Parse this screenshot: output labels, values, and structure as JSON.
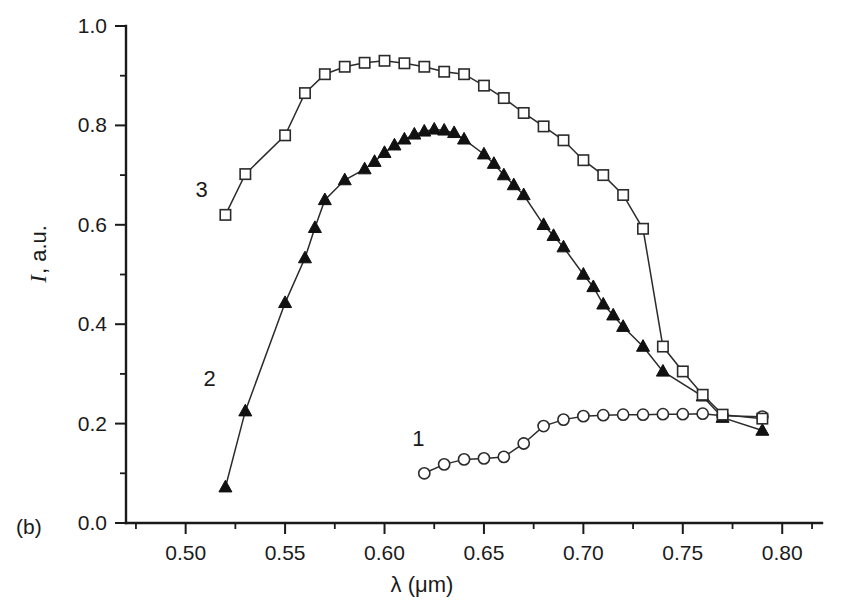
{
  "figure": {
    "panel_label": "(b)",
    "background_color": "#ffffff",
    "ink_color": "#1a1a1a"
  },
  "chart_data": {
    "type": "line",
    "title": "",
    "subtitle": "",
    "xlabel": "λ (μm)",
    "ylabel": "I, a.u.",
    "ylabel_italic_part": "I",
    "ylabel_rest": ", a.u.",
    "xlim": [
      0.47,
      0.82
    ],
    "ylim": [
      0.0,
      1.0
    ],
    "grid": false,
    "legend_position": "inline-curve-labels",
    "x_ticks_major": [
      0.5,
      0.55,
      0.6,
      0.65,
      0.7,
      0.75,
      0.8
    ],
    "x_tick_labels": [
      "0.50",
      "0.55",
      "0.60",
      "0.65",
      "0.70",
      "0.75",
      "0.80"
    ],
    "x_ticks_minor": [
      0.475,
      0.525,
      0.575,
      0.625,
      0.675,
      0.725,
      0.775,
      0.815
    ],
    "y_ticks_major": [
      0.0,
      0.2,
      0.4,
      0.6,
      0.8,
      1.0
    ],
    "y_tick_labels": [
      "0.0",
      "0.2",
      "0.4",
      "0.6",
      "0.8",
      "1.0"
    ],
    "y_ticks_minor": [
      0.1,
      0.3,
      0.5,
      0.7,
      0.9
    ],
    "annotations": [
      {
        "text": "1",
        "x": 0.617,
        "y": 0.155,
        "series": "1"
      },
      {
        "text": "2",
        "x": 0.512,
        "y": 0.275,
        "series": "2"
      },
      {
        "text": "3",
        "x": 0.508,
        "y": 0.655,
        "series": "3"
      },
      {
        "text": "(b)",
        "x": 0.468,
        "y": -0.045,
        "series": "panel"
      }
    ],
    "series": [
      {
        "name": "1",
        "marker": "open-circle",
        "line_style": "solid",
        "x": [
          0.62,
          0.63,
          0.64,
          0.65,
          0.66,
          0.67,
          0.68,
          0.69,
          0.7,
          0.71,
          0.72,
          0.73,
          0.74,
          0.75,
          0.76,
          0.77,
          0.79
        ],
        "y": [
          0.1,
          0.118,
          0.128,
          0.13,
          0.133,
          0.16,
          0.195,
          0.208,
          0.215,
          0.217,
          0.218,
          0.218,
          0.219,
          0.219,
          0.22,
          0.216,
          0.214
        ]
      },
      {
        "name": "2",
        "marker": "filled-triangle",
        "line_style": "solid",
        "x": [
          0.52,
          0.53,
          0.55,
          0.56,
          0.565,
          0.57,
          0.58,
          0.59,
          0.595,
          0.6,
          0.605,
          0.61,
          0.615,
          0.62,
          0.625,
          0.63,
          0.635,
          0.64,
          0.65,
          0.655,
          0.66,
          0.665,
          0.67,
          0.68,
          0.685,
          0.69,
          0.7,
          0.705,
          0.71,
          0.715,
          0.72,
          0.73,
          0.74,
          0.76,
          0.77,
          0.79
        ],
        "y": [
          0.072,
          0.225,
          0.443,
          0.533,
          0.594,
          0.65,
          0.69,
          0.712,
          0.727,
          0.745,
          0.76,
          0.772,
          0.782,
          0.788,
          0.792,
          0.79,
          0.785,
          0.772,
          0.742,
          0.723,
          0.7,
          0.68,
          0.66,
          0.6,
          0.578,
          0.555,
          0.5,
          0.475,
          0.44,
          0.418,
          0.395,
          0.355,
          0.305,
          0.255,
          0.212,
          0.186
        ]
      },
      {
        "name": "3",
        "marker": "open-square",
        "line_style": "solid",
        "x": [
          0.52,
          0.53,
          0.55,
          0.56,
          0.57,
          0.58,
          0.59,
          0.6,
          0.61,
          0.62,
          0.63,
          0.64,
          0.65,
          0.66,
          0.67,
          0.68,
          0.69,
          0.7,
          0.71,
          0.72,
          0.73,
          0.74,
          0.76,
          0.77,
          0.79
        ],
        "y": [
          0.62,
          0.702,
          0.78,
          0.865,
          0.903,
          0.918,
          0.926,
          0.93,
          0.925,
          0.918,
          0.908,
          0.903,
          0.88,
          0.855,
          0.825,
          0.798,
          0.77,
          0.73,
          0.7,
          0.66,
          0.592,
          0.52,
          0.47,
          0.415,
          0.355
        ]
      }
    ],
    "series3_tail": {
      "note": "curve 3 continues to convergence",
      "x": [
        0.74,
        0.75,
        0.76,
        0.77,
        0.79
      ],
      "y": [
        0.355,
        0.305,
        0.258,
        0.218,
        0.21
      ]
    }
  }
}
